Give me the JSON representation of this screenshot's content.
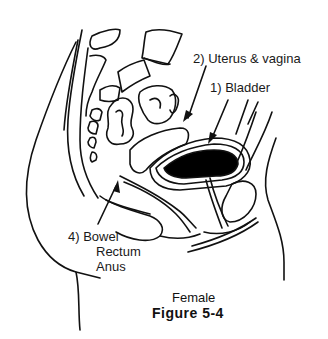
{
  "figure": {
    "subtitle": "Female",
    "title": "Figure 5-4",
    "stroke_color": "#111111",
    "fill_color": "#000000"
  },
  "labels": {
    "uterus": "2) Uterus & vagina",
    "bladder": "1) Bladder",
    "bowel": [
      "4) Bowel",
      "Rectum",
      "Anus"
    ]
  }
}
